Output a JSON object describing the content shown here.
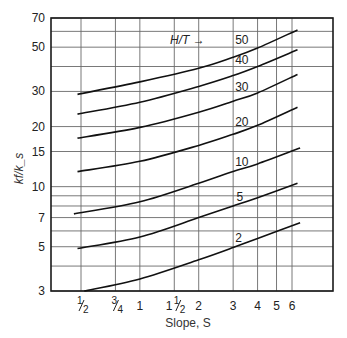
{
  "chart_data": {
    "type": "line",
    "title": "",
    "xlabel": "Slope, S",
    "ylabel": "k_f / k_s",
    "xscale": "log",
    "yscale": "log",
    "xlim": [
      0.4,
      9.5
    ],
    "ylim": [
      3,
      70
    ],
    "grid": true,
    "x_ticks": [
      {
        "value": 0.5,
        "label": "1/2",
        "whole": "",
        "num": "1",
        "den": "2"
      },
      {
        "value": 0.75,
        "label": "3/4",
        "whole": "",
        "num": "3",
        "den": "4"
      },
      {
        "value": 1,
        "label": "1",
        "whole": "1",
        "num": "",
        "den": ""
      },
      {
        "value": 1.5,
        "label": "1 1/2",
        "whole": "1",
        "num": "1",
        "den": "2"
      },
      {
        "value": 2,
        "label": "2",
        "whole": "2",
        "num": "",
        "den": ""
      },
      {
        "value": 3,
        "label": "3",
        "whole": "3",
        "num": "",
        "den": ""
      },
      {
        "value": 4,
        "label": "4",
        "whole": "4",
        "num": "",
        "den": ""
      },
      {
        "value": 5,
        "label": "5",
        "whole": "5",
        "num": "",
        "den": ""
      },
      {
        "value": 6,
        "label": "6",
        "whole": "6",
        "num": "",
        "den": ""
      }
    ],
    "y_tick_labels": [
      3,
      5,
      7,
      10,
      15,
      20,
      30,
      50,
      70
    ],
    "y_gridlines": [
      3,
      4,
      5,
      6,
      7,
      8,
      9,
      10,
      15,
      20,
      30,
      40,
      50,
      60,
      70
    ],
    "legend_title": "H/T →",
    "series": [
      {
        "name": "50",
        "label_at": [
          3.0,
          50
        ],
        "points": [
          [
            0.48,
            29.0
          ],
          [
            1,
            33.5
          ],
          [
            2,
            39.2
          ],
          [
            3,
            44.5
          ],
          [
            4,
            49.5
          ],
          [
            6.4,
            61.0
          ]
        ]
      },
      {
        "name": "40",
        "label_at": [
          3.0,
          40
        ],
        "points": [
          [
            0.48,
            23.1
          ],
          [
            1,
            26.5
          ],
          [
            2,
            31.8
          ],
          [
            3,
            36.0
          ],
          [
            4,
            40.0
          ],
          [
            6.4,
            48.5
          ]
        ]
      },
      {
        "name": "30",
        "label_at": [
          3.0,
          29
        ],
        "points": [
          [
            0.48,
            17.5
          ],
          [
            1,
            19.8
          ],
          [
            2,
            23.6
          ],
          [
            3,
            26.8
          ],
          [
            4,
            29.5
          ],
          [
            6.4,
            36.5
          ]
        ]
      },
      {
        "name": "20",
        "label_at": [
          3.0,
          19.5
        ],
        "points": [
          [
            0.48,
            11.9
          ],
          [
            1,
            13.4
          ],
          [
            2,
            16.1
          ],
          [
            3,
            18.3
          ],
          [
            4,
            20.3
          ],
          [
            6.4,
            25.0
          ]
        ]
      },
      {
        "name": "10",
        "label_at": [
          3.0,
          12.2
        ],
        "points": [
          [
            0.46,
            7.3
          ],
          [
            1,
            8.4
          ],
          [
            2,
            10.4
          ],
          [
            3,
            11.9
          ],
          [
            4,
            13.0
          ],
          [
            6.6,
            15.6
          ]
        ]
      },
      {
        "name": "5",
        "label_at": [
          3.05,
          8.2
        ],
        "points": [
          [
            0.48,
            4.9
          ],
          [
            1,
            5.6
          ],
          [
            2,
            7.0
          ],
          [
            3,
            8.0
          ],
          [
            4,
            8.8
          ],
          [
            6.4,
            10.4
          ]
        ]
      },
      {
        "name": "2",
        "label_at": [
          3.0,
          5.1
        ],
        "points": [
          [
            0.52,
            3.0
          ],
          [
            1,
            3.45
          ],
          [
            2,
            4.3
          ],
          [
            3,
            4.95
          ],
          [
            4,
            5.5
          ],
          [
            6.6,
            6.6
          ]
        ]
      }
    ]
  }
}
